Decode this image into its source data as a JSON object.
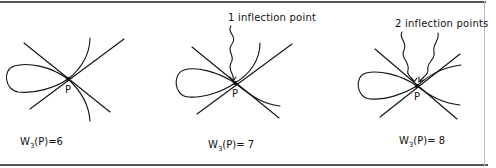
{
  "figure": {
    "panels": [
      {
        "id": "panel-1",
        "point_label": "P",
        "weight": {
          "prefix": "W",
          "subscript": "3",
          "suffix": "(P)=6"
        },
        "annotation": null
      },
      {
        "id": "panel-2",
        "point_label": "P",
        "weight": {
          "prefix": "W",
          "subscript": "3",
          "suffix": "(P)= 7"
        },
        "annotation": "1 inflection point"
      },
      {
        "id": "panel-3",
        "point_label": "P",
        "weight": {
          "prefix": "W",
          "subscript": "3",
          "suffix": "(P)= 8"
        },
        "annotation": "2 inflection points"
      }
    ],
    "colors": {
      "ink": "#111111",
      "rule": "#555555",
      "background": "#ffffff"
    }
  }
}
